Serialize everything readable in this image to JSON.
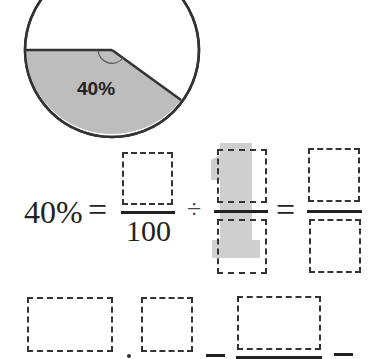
{
  "pie": {
    "label": "40%",
    "shaded_percent": 40,
    "fill_color": "#bdbdbd",
    "stroke_color": "#333333"
  },
  "equation1": {
    "lhs": "40%",
    "equals": "=",
    "fraction1": {
      "numerator": "",
      "denominator": "100"
    },
    "divide": "÷",
    "fraction2": {
      "numerator": "",
      "denominator": "",
      "highlight_glyph": "1"
    },
    "equals2": "=",
    "fraction3": {
      "numerator": "",
      "denominator": ""
    }
  },
  "equation2": {
    "boxes": [
      "",
      "",
      ""
    ],
    "operator1": "÷",
    "equals": "=",
    "equals2": "="
  }
}
